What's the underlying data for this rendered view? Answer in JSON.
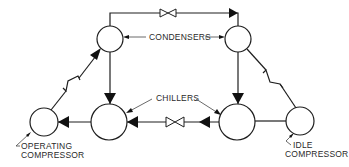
{
  "diagram": {
    "labels": {
      "condensers": "CONDENSERS",
      "chillers": "CHILLERS",
      "operating_compressor_line1": "OPERATING",
      "operating_compressor_line2": "COMPRESSOR",
      "idle_compressor_line1": "IDLE",
      "idle_compressor_line2": "COMPRESSOR"
    },
    "nodes": [
      {
        "id": "condenser-left",
        "type": "condenser"
      },
      {
        "id": "condenser-right",
        "type": "condenser"
      },
      {
        "id": "chiller-left",
        "type": "chiller"
      },
      {
        "id": "chiller-right",
        "type": "chiller"
      },
      {
        "id": "operating-compressor",
        "type": "compressor",
        "state": "operating"
      },
      {
        "id": "idle-compressor",
        "type": "compressor",
        "state": "idle"
      }
    ],
    "valves": [
      {
        "id": "condenser-crossover-valve",
        "location": "top pipe between condensers"
      },
      {
        "id": "chiller-crossover-valve",
        "location": "pipe between chillers"
      }
    ],
    "colors": {
      "line": "#1e1e1e",
      "background": "#ffffff",
      "text": "#2a2a2a"
    }
  }
}
